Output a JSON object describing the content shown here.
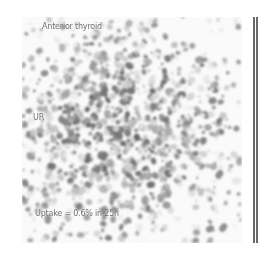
{
  "image": {
    "type": "thyroid scintigraphy scan",
    "view_label": "Anterior thyroid",
    "side_marker": "UR",
    "uptake_text": "Uptake = 0.6% in 25h",
    "colors": {
      "background": "#ffffff",
      "counts_dark": "#3a3a3a",
      "label_text": "#6e6e6e",
      "frame_bar": "#6a6a6a"
    }
  }
}
